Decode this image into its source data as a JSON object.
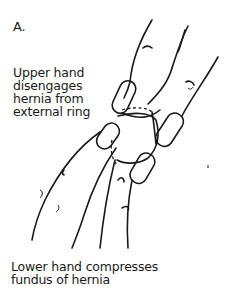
{
  "figure": {
    "panel_letter": "A.",
    "upper_caption": "Upper hand\ndisengages\nhernia from\nexternal ring",
    "lower_caption": "Lower hand compresses\nfundus of hernia",
    "illustration": {
      "subject": "two hands reducing an inguinal hernia",
      "elements": [
        "upper-hand",
        "lower-hand",
        "hernia-sac",
        "external-ring"
      ]
    }
  }
}
